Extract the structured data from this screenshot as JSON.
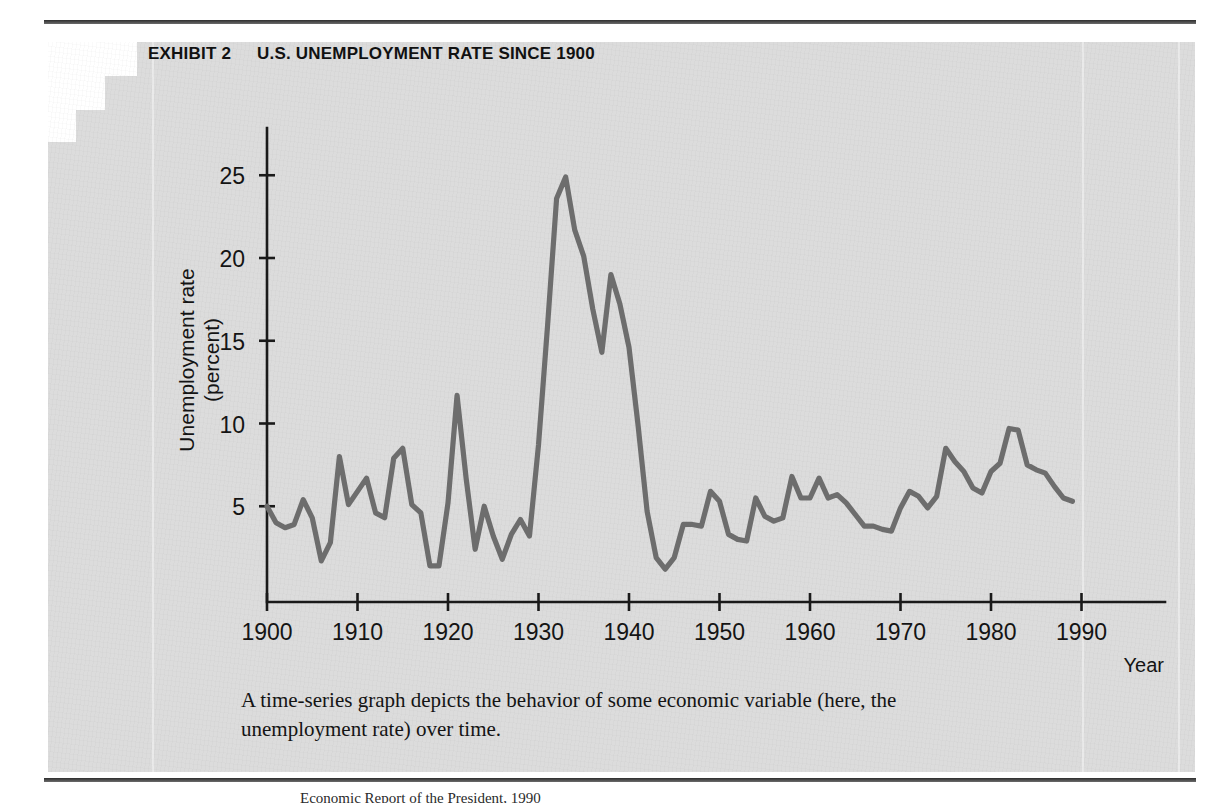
{
  "exhibit": {
    "label": "EXHIBIT 2",
    "title": "U.S. UNEMPLOYMENT RATE SINCE 1900"
  },
  "caption": "A time-series graph depicts the behavior of some economic variable (here, the unemployment rate) over time.",
  "source_note": "Economic Report of the President, 1990",
  "colors": {
    "panel": "#dcdcdc",
    "page": "#ffffff",
    "line": "#6d6d6d",
    "axis": "#1a1a1a",
    "text": "#141414",
    "rule": "#3b3b3b"
  },
  "chart_data": {
    "type": "line",
    "title": "U.S. UNEMPLOYMENT RATE SINCE 1900",
    "xlabel": "Year",
    "ylabel": "Unemployment rate (percent)",
    "xlim": [
      1900,
      1993
    ],
    "ylim": [
      0,
      27.5
    ],
    "grid": false,
    "legend": false,
    "xticks": [
      1900,
      1910,
      1920,
      1930,
      1940,
      1950,
      1960,
      1970,
      1980,
      1990
    ],
    "xtick_labels": [
      "1900",
      "1910",
      "1920",
      "1930",
      "1940",
      "1950",
      "1960",
      "1970",
      "1980",
      "1990"
    ],
    "yticks": [
      5,
      10,
      15,
      20,
      25
    ],
    "ytick_labels": [
      "5",
      "10",
      "15",
      "20",
      "25"
    ],
    "series": [
      {
        "name": "Unemployment rate (percent)",
        "x": [
          1900,
          1901,
          1902,
          1903,
          1904,
          1905,
          1906,
          1907,
          1908,
          1909,
          1910,
          1911,
          1912,
          1913,
          1914,
          1915,
          1916,
          1917,
          1918,
          1919,
          1920,
          1921,
          1922,
          1923,
          1924,
          1925,
          1926,
          1927,
          1928,
          1929,
          1930,
          1931,
          1932,
          1933,
          1934,
          1935,
          1936,
          1937,
          1938,
          1939,
          1940,
          1941,
          1942,
          1943,
          1944,
          1945,
          1946,
          1947,
          1948,
          1949,
          1950,
          1951,
          1952,
          1953,
          1954,
          1955,
          1956,
          1957,
          1958,
          1959,
          1960,
          1961,
          1962,
          1963,
          1964,
          1965,
          1966,
          1967,
          1968,
          1969,
          1970,
          1971,
          1972,
          1973,
          1974,
          1975,
          1976,
          1977,
          1978,
          1979,
          1980,
          1981,
          1982,
          1983,
          1984,
          1985,
          1986,
          1987,
          1988,
          1989
        ],
        "values": [
          5.0,
          4.0,
          3.7,
          3.9,
          5.4,
          4.3,
          1.7,
          2.8,
          8.0,
          5.1,
          5.9,
          6.7,
          4.6,
          4.3,
          7.9,
          8.5,
          5.1,
          4.6,
          1.4,
          1.4,
          5.2,
          11.7,
          6.7,
          2.4,
          5.0,
          3.2,
          1.8,
          3.3,
          4.2,
          3.2,
          8.7,
          15.9,
          23.6,
          24.9,
          21.7,
          20.1,
          16.9,
          14.3,
          19.0,
          17.2,
          14.6,
          9.9,
          4.7,
          1.9,
          1.2,
          1.9,
          3.9,
          3.9,
          3.8,
          5.9,
          5.3,
          3.3,
          3.0,
          2.9,
          5.5,
          4.4,
          4.1,
          4.3,
          6.8,
          5.5,
          5.5,
          6.7,
          5.5,
          5.7,
          5.2,
          4.5,
          3.8,
          3.8,
          3.6,
          3.5,
          4.9,
          5.9,
          5.6,
          4.9,
          5.6,
          8.5,
          7.7,
          7.1,
          6.1,
          5.8,
          7.1,
          7.6,
          9.7,
          9.6,
          7.5,
          7.2,
          7.0,
          6.2,
          5.5,
          5.3
        ]
      }
    ]
  }
}
